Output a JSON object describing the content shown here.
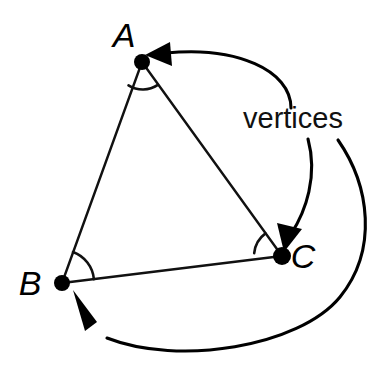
{
  "figure": {
    "background_color": "#ffffff",
    "stroke_color": "#111111",
    "dot_color": "#000000",
    "callout": {
      "text": "vertices",
      "x": 243,
      "y": 128,
      "font_size": 29
    },
    "vertices": [
      {
        "id": "A",
        "label": "A",
        "point": {
          "x": 142,
          "y": 62
        },
        "label_pos": {
          "x": 124,
          "y": 47
        },
        "dot_radius": 8,
        "angle_arc": {
          "radius": 27,
          "start_deg": 240,
          "end_deg": 306
        }
      },
      {
        "id": "B",
        "label": "B",
        "point": {
          "x": 62,
          "y": 283
        },
        "label_pos": {
          "x": 22,
          "y": 295
        },
        "dot_radius": 8,
        "angle_arc": {
          "radius": 32,
          "start_deg": 290,
          "end_deg": 358
        }
      },
      {
        "id": "C",
        "label": "C",
        "point": {
          "x": 282,
          "y": 256
        },
        "label_pos": {
          "x": 292,
          "y": 268
        },
        "dot_radius": 9,
        "angle_arc": {
          "radius": 28,
          "start_deg": 126,
          "end_deg": 186
        }
      }
    ],
    "edges": [
      {
        "id": "AB",
        "from": "A",
        "to": "B"
      },
      {
        "id": "AC",
        "from": "A",
        "to": "C"
      },
      {
        "id": "BC",
        "from": "B",
        "to": "C"
      }
    ],
    "pointers": [
      {
        "id": "pointer-to-a",
        "target": "A",
        "path": "M 291 108 C 291 70 236 46 166 53",
        "head_points": "168,44 147,56 170,65",
        "head_rotate": 0
      },
      {
        "id": "pointer-to-c",
        "target": "C",
        "path": "M 308 139 C 316 175 304 210 290 236",
        "head_points": "299,231 283,252 278,226",
        "head_rotate": 0
      },
      {
        "id": "pointer-to-b",
        "target": "B",
        "path": "M 338 140 C 368 185 376 248 340 296 C 300 345 180 364 105 337",
        "head_points": "95,324 74,291 84,331",
        "head_rotate": 0
      }
    ]
  }
}
